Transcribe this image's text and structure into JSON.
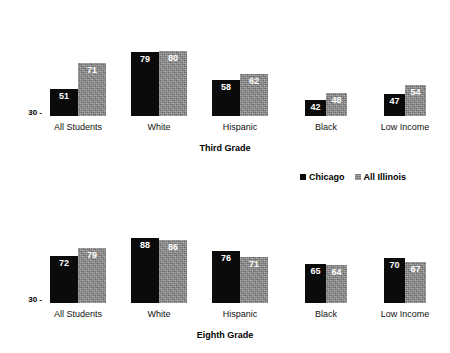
{
  "legend": {
    "entries": [
      {
        "label": "Chicago",
        "color": "#0b0b0b",
        "swatch": "black-square-icon"
      },
      {
        "label": "All Illinois",
        "color": "#8d8d8d",
        "swatch": "gray-square-icon"
      }
    ]
  },
  "charts": [
    {
      "id": "third",
      "title": "Third Grade",
      "axis_tick_label": "30 -",
      "categories": [
        "All Students",
        "White",
        "Hispanic",
        "Black",
        "Low Income"
      ],
      "series": [
        {
          "name": "Chicago",
          "values": [
            51,
            79,
            58,
            42,
            47
          ]
        },
        {
          "name": "All Illinois",
          "values": [
            71,
            80,
            62,
            48,
            54
          ]
        }
      ]
    },
    {
      "id": "eighth",
      "title": "Eighth Grade",
      "axis_tick_label": "30 -",
      "categories": [
        "All Students",
        "White",
        "Hispanic",
        "Black",
        "Low Income"
      ],
      "series": [
        {
          "name": "Chicago",
          "values": [
            72,
            88,
            76,
            65,
            70
          ]
        },
        {
          "name": "All Illinois",
          "values": [
            79,
            86,
            71,
            64,
            67
          ]
        }
      ]
    }
  ],
  "chart_data": [
    {
      "type": "bar",
      "title": "Third Grade",
      "xlabel": "",
      "ylabel": "",
      "ylim": [
        30,
        90
      ],
      "grid": false,
      "legend_position": "between-charts-right",
      "ytick_labels": [
        "30"
      ],
      "categories": [
        "All Students",
        "White",
        "Hispanic",
        "Black",
        "Low Income"
      ],
      "series": [
        {
          "name": "Chicago",
          "values": [
            51,
            79,
            58,
            42,
            47
          ]
        },
        {
          "name": "All Illinois",
          "values": [
            71,
            80,
            62,
            48,
            54
          ]
        }
      ]
    },
    {
      "type": "bar",
      "title": "Eighth Grade",
      "xlabel": "",
      "ylabel": "",
      "ylim": [
        30,
        95
      ],
      "grid": false,
      "legend_position": "between-charts-right",
      "ytick_labels": [
        "30"
      ],
      "categories": [
        "All Students",
        "White",
        "Hispanic",
        "Black",
        "Low Income"
      ],
      "series": [
        {
          "name": "Chicago",
          "values": [
            72,
            88,
            76,
            65,
            70
          ]
        },
        {
          "name": "All Illinois",
          "values": [
            79,
            86,
            71,
            64,
            67
          ]
        }
      ]
    }
  ]
}
